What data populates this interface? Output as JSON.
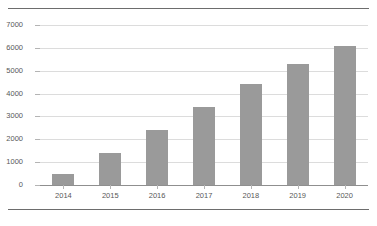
{
  "figure": {
    "background_color": "#ffffff",
    "rule_color": "#6d6d6d",
    "has_top_rule": true,
    "has_bottom_rule": true
  },
  "style": {
    "bar_color": "#9a9a9a",
    "gridline_color": "#dcdcdc",
    "axis_color": "#8f8f8f",
    "tick_label_color": "#585858"
  },
  "chart_data": {
    "type": "bar",
    "title": "",
    "subtitle": "",
    "xlabel": "",
    "ylabel": "",
    "categories": [
      "2014",
      "2015",
      "2016",
      "2017",
      "2018",
      "2019",
      "2020"
    ],
    "values": [
      500,
      1400,
      2400,
      3400,
      4400,
      5300,
      6100
    ],
    "series": [
      {
        "name": "",
        "values": [
          500,
          1400,
          2400,
          3400,
          4400,
          5300,
          6100
        ]
      }
    ],
    "ylim": [
      0,
      7000
    ],
    "ytick_values": [
      0,
      1000,
      2000,
      3000,
      4000,
      5000,
      6000,
      7000
    ],
    "ytick_labels": [
      "0",
      "1000",
      "2000",
      "3000",
      "4000",
      "5000",
      "6000",
      "7000"
    ],
    "xtick_labels": [
      "2014",
      "2015",
      "2016",
      "2017",
      "2018",
      "2019",
      "2020"
    ],
    "grid": true,
    "grid_axis": "y",
    "legend": false,
    "legend_position": "none",
    "annotations": [],
    "data_labels": false
  }
}
